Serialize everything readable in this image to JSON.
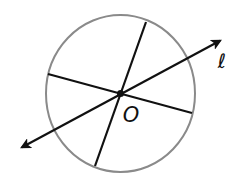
{
  "diagram": {
    "type": "geometry",
    "colors": {
      "circle": "#8a8a8a",
      "lines": "#111111",
      "background": "#ffffff"
    },
    "circle": {
      "cx": 120.5,
      "cy": 93.5,
      "rx": 74.5,
      "ry": 78.5
    },
    "center_point": {
      "label": "O",
      "x": 120.5,
      "y": 93.5
    },
    "segments": [
      {
        "name": "diameter-steep",
        "x1": 146,
        "y1": 22,
        "x2": 95,
        "y2": 166
      },
      {
        "name": "diameter-shallow",
        "x1": 48,
        "y1": 74,
        "x2": 192,
        "y2": 113
      }
    ],
    "line_l": {
      "label": "ℓ",
      "x1": 17,
      "y1": 150,
      "x2": 225,
      "y2": 38
    },
    "labels": {
      "center": "O",
      "line": "ℓ"
    }
  }
}
